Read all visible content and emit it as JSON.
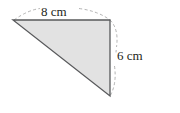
{
  "figure": {
    "type": "geometry-diagram",
    "shape_name": "right-triangle",
    "background_color": "#ffffff",
    "fill_color": "#e2e2e2",
    "stroke_color": "#58595b",
    "dashed_color": "#9a9a9a",
    "text_color": "#231f20",
    "labels": {
      "top": "8 cm",
      "right": "6 cm"
    },
    "measurements": [
      {
        "side": "top",
        "value": 8,
        "unit": "cm",
        "text": "8 cm"
      },
      {
        "side": "right",
        "value": 6,
        "unit": "cm",
        "text": "6 cm"
      }
    ],
    "vertices": {
      "left": {
        "x": 13,
        "y": 20
      },
      "top_right": {
        "x": 110,
        "y": 20
      },
      "bottom_right": {
        "x": 110,
        "y": 96
      }
    },
    "guides": [
      {
        "name": "top-dashed-arc",
        "style": "dashed",
        "from": "left",
        "to": "top_right",
        "bulge": "up"
      },
      {
        "name": "right-dashed-arc",
        "style": "dashed",
        "from": "top_right",
        "to": "bottom_right",
        "bulge": "right"
      }
    ]
  }
}
